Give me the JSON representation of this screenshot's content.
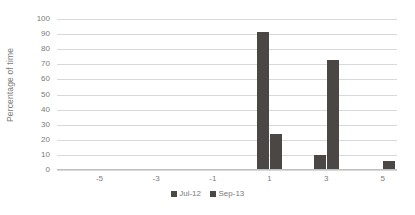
{
  "chart_data": {
    "type": "bar",
    "title": "",
    "subtitle": "",
    "xlabel": "",
    "ylabel": "Percentage of time",
    "ylim": [
      0,
      100
    ],
    "ytick_labels": [
      "100",
      "90",
      "80",
      "70",
      "60",
      "50",
      "40",
      "30",
      "20",
      "10",
      "0"
    ],
    "ytick_values": [
      100,
      90,
      80,
      70,
      60,
      50,
      40,
      30,
      20,
      10,
      0
    ],
    "categories": [
      -6,
      -5,
      -4,
      -3,
      -2,
      -1,
      0,
      1,
      2,
      3,
      4,
      5
    ],
    "xtick_labels": [
      "-5",
      "-3",
      "-1",
      "1",
      "3",
      "5"
    ],
    "xtick_categories": [
      -5,
      -3,
      -1,
      1,
      3,
      5
    ],
    "grid": true,
    "legend_position": "bottom",
    "series": [
      {
        "name": "Jul-12",
        "color": "#4a4745",
        "values": [
          0,
          0,
          0,
          0,
          0,
          0,
          0,
          91,
          0,
          9,
          0,
          0
        ]
      },
      {
        "name": "Sep-13",
        "color": "#4a4745",
        "values": [
          0,
          0,
          0,
          0,
          0,
          0,
          0,
          23,
          0,
          72,
          0,
          5
        ]
      }
    ]
  },
  "axes": {
    "y_title": "Percentage of time"
  },
  "style": {
    "gridline_color": "#d9d9d9",
    "axis_color": "#bfbfbf",
    "text_color": "#7b7b7b",
    "background": "#ffffff"
  }
}
